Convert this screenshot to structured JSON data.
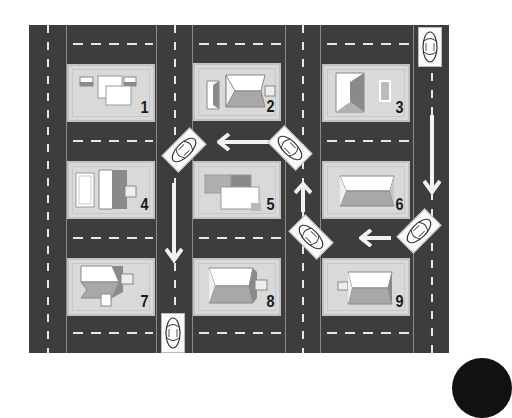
{
  "diagram": {
    "type": "street-map",
    "colors": {
      "road": "#3d3d3d",
      "block": "#d9d9d9",
      "marking": "#e8e8e8",
      "roof_light": "#ffffff",
      "roof_dark": "#9a9a9a"
    },
    "houses": [
      {
        "number": "1",
        "row": 1,
        "col": 1
      },
      {
        "number": "2",
        "row": 1,
        "col": 2
      },
      {
        "number": "3",
        "row": 1,
        "col": 3
      },
      {
        "number": "4",
        "row": 2,
        "col": 1
      },
      {
        "number": "5",
        "row": 2,
        "col": 2
      },
      {
        "number": "6",
        "row": 2,
        "col": 3
      },
      {
        "number": "7",
        "row": 3,
        "col": 1
      },
      {
        "number": "8",
        "row": 3,
        "col": 2
      },
      {
        "number": "9",
        "row": 3,
        "col": 3
      }
    ],
    "cars": [
      {
        "id": "car-start-top-right",
        "orientation": "vertical"
      },
      {
        "id": "car-turn-near-6",
        "orientation": "diagonal"
      },
      {
        "id": "car-turn-near-5",
        "orientation": "diagonal"
      },
      {
        "id": "car-turn-near-2",
        "orientation": "diagonal"
      },
      {
        "id": "car-turn-near-1",
        "orientation": "diagonal"
      },
      {
        "id": "car-end-bottom",
        "orientation": "vertical"
      }
    ],
    "arrows": [
      {
        "direction": "down",
        "location": "right road beside houses 3 and 6"
      },
      {
        "direction": "left",
        "location": "between rows 2 and 3, between houses 6 and 9"
      },
      {
        "direction": "up",
        "location": "road between houses 5 and 6"
      },
      {
        "direction": "left",
        "location": "between rows 1 and 2, between houses 2 and 5"
      },
      {
        "direction": "down",
        "location": "road between houses 4/7 and 5/8"
      }
    ]
  }
}
